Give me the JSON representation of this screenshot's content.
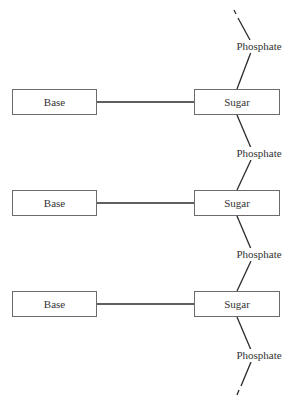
{
  "diagram": {
    "title": "",
    "units": [
      {
        "base": "Base",
        "sugar": "Sugar"
      },
      {
        "base": "Base",
        "sugar": "Sugar"
      },
      {
        "base": "Base",
        "sugar": "Sugar"
      }
    ],
    "phosphates": [
      "Phosphate",
      "Phosphate",
      "Phosphate",
      "Phosphate"
    ],
    "colors": {
      "line": "#2a2a2a",
      "box_border": "#6b6b6b",
      "text": "#333333"
    }
  }
}
